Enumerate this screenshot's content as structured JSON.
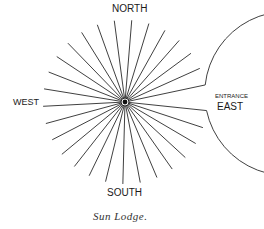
{
  "diagram": {
    "title": "Sun Lodge",
    "caption": "Sun Lodge.",
    "labels": {
      "north": "NORTH",
      "south": "SOUTH",
      "west": "WEST",
      "entrance": "ENTRANCE",
      "east": "EAST"
    },
    "geometry": {
      "center": [
        125,
        102
      ],
      "radius": 82,
      "spoke_count": 28,
      "entrance_gap_degrees": [
        -6,
        12
      ]
    },
    "colors": {
      "line": "#2a2a2a",
      "background": "#ffffff"
    }
  }
}
